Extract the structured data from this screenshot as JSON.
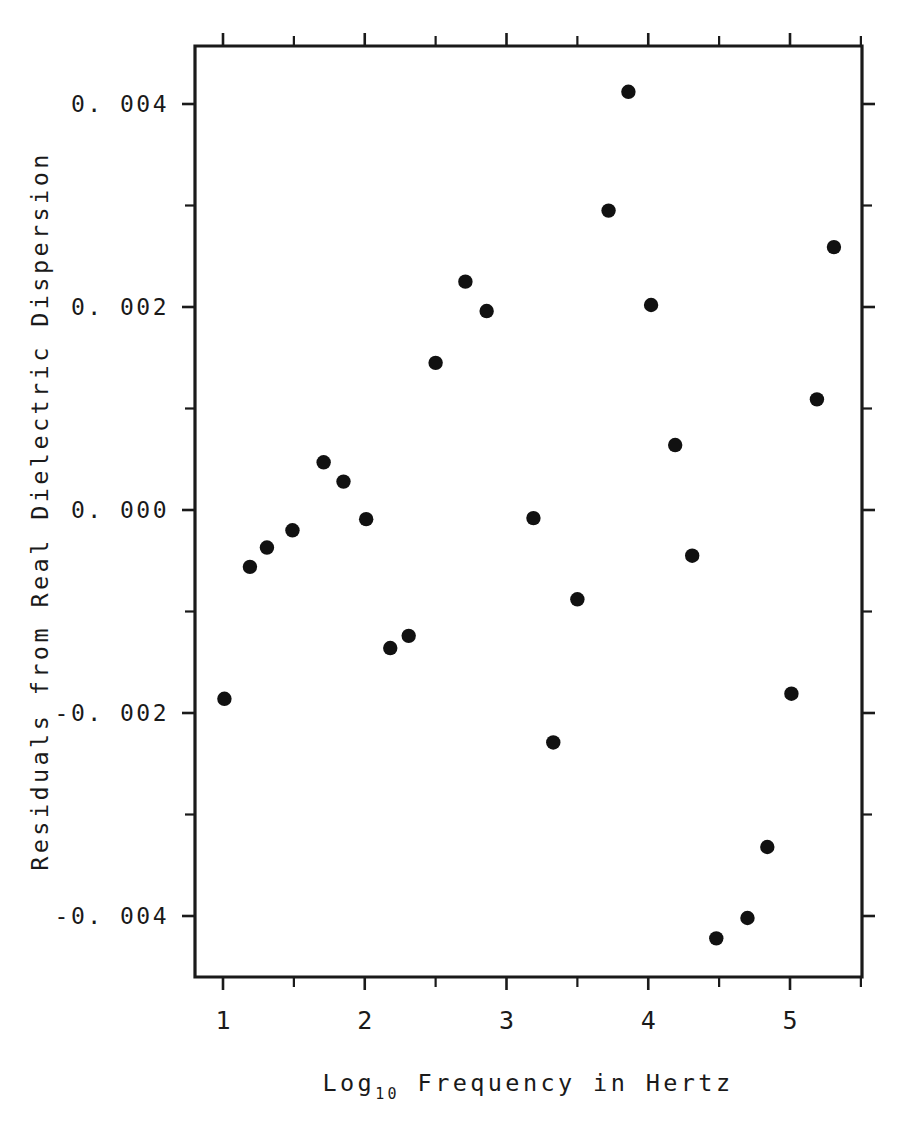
{
  "chart_data": {
    "type": "scatter",
    "title": "",
    "xlabel": "Log10 Frequency in Hertz",
    "xlabel_base": "Log",
    "xlabel_sub": "10",
    "xlabel_rest": " Frequency in Hertz",
    "ylabel": "Residuals from Real Dielectric Dispersion",
    "xlim": [
      0.8,
      5.5
    ],
    "ylim": [
      -0.00505,
      0.00505
    ],
    "grid": false,
    "legend": null,
    "marker": "filled-circle",
    "marker_color": "#111111",
    "xticks": [
      1,
      2,
      3,
      4,
      5
    ],
    "xtick_labels": [
      "1",
      "2",
      "3",
      "4",
      "5"
    ],
    "xticks_minor": [
      1.5,
      2.5,
      3.5,
      4.5,
      5.5
    ],
    "yticks": [
      -0.004,
      -0.002,
      0.0,
      0.002,
      0.004
    ],
    "ytick_labels": [
      "-0. 004",
      "-0. 002",
      "0. 000",
      "0. 002",
      "0. 004"
    ],
    "yticks_minor": [
      -0.003,
      -0.001,
      0.001,
      0.003
    ],
    "x": [
      1.01,
      1.19,
      1.31,
      1.49,
      1.71,
      1.85,
      2.01,
      2.18,
      2.31,
      2.5,
      2.71,
      2.86,
      3.19,
      3.33,
      3.5,
      3.72,
      3.86,
      4.02,
      4.19,
      4.31,
      4.48,
      4.7,
      4.84,
      5.01,
      5.19,
      5.31
    ],
    "y": [
      -0.00186,
      -0.00056,
      -0.00037,
      -0.0002,
      0.00047,
      0.00028,
      -9e-05,
      -0.00136,
      -0.00124,
      0.00145,
      0.00225,
      0.00196,
      -8e-05,
      -0.00229,
      -0.00088,
      0.00295,
      0.00412,
      0.00202,
      0.00064,
      -0.00045,
      -0.00422,
      -0.00402,
      -0.00332,
      -0.00181,
      0.00109,
      0.00259
    ],
    "points": [
      {
        "x": 1.01,
        "y": -0.00186
      },
      {
        "x": 1.19,
        "y": -0.00056
      },
      {
        "x": 1.31,
        "y": -0.00037
      },
      {
        "x": 1.49,
        "y": -0.0002
      },
      {
        "x": 1.71,
        "y": 0.00047
      },
      {
        "x": 1.85,
        "y": 0.00028
      },
      {
        "x": 2.01,
        "y": -9e-05
      },
      {
        "x": 2.18,
        "y": -0.00136
      },
      {
        "x": 2.31,
        "y": -0.00124
      },
      {
        "x": 2.5,
        "y": 0.00145
      },
      {
        "x": 2.71,
        "y": 0.00225
      },
      {
        "x": 2.86,
        "y": 0.00196
      },
      {
        "x": 3.19,
        "y": -8e-05
      },
      {
        "x": 3.33,
        "y": -0.00229
      },
      {
        "x": 3.5,
        "y": -0.00088
      },
      {
        "x": 3.72,
        "y": 0.00295
      },
      {
        "x": 3.86,
        "y": 0.00412
      },
      {
        "x": 4.02,
        "y": 0.00202
      },
      {
        "x": 4.19,
        "y": 0.00064
      },
      {
        "x": 4.31,
        "y": -0.00045
      },
      {
        "x": 4.48,
        "y": -0.00422
      },
      {
        "x": 4.7,
        "y": -0.00402
      },
      {
        "x": 4.84,
        "y": -0.00332
      },
      {
        "x": 5.01,
        "y": -0.00181
      },
      {
        "x": 5.19,
        "y": 0.00109
      },
      {
        "x": 5.31,
        "y": 0.00259
      }
    ]
  },
  "axes_geometry": {
    "left_px": 195,
    "right_px": 862,
    "top_px": 46,
    "bottom_px": 977,
    "x_at_1_px": 223,
    "x_per_unit_px": 141.75,
    "y_at_0_px": 510,
    "y_per_0002_px": 203,
    "marker_radius_px": 7.2,
    "tick_len_px": 13
  }
}
